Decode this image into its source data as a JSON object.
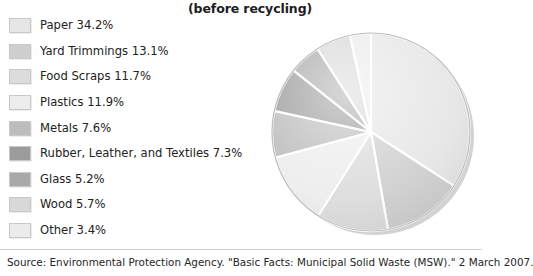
{
  "title": "(before recycling)",
  "source_note": "Source: Environmental Protection Agency. \"Basic Facts: Municipal Solid Waste (MSW).\" 2 March 2007.",
  "legend": {
    "items": [
      {
        "label": "Paper 34.2%",
        "name": "Paper",
        "value": 34.2,
        "color": "#e6e6e6"
      },
      {
        "label": "Yard Trimmings 13.1%",
        "name": "Yard Trimmings",
        "value": 13.1,
        "color": "#cfcfcf"
      },
      {
        "label": "Food Scraps 11.7%",
        "name": "Food Scraps",
        "value": 11.7,
        "color": "#dcdcdc"
      },
      {
        "label": "Plastics 11.9%",
        "name": "Plastics",
        "value": 11.9,
        "color": "#ededed"
      },
      {
        "label": "Metals 7.6%",
        "name": "Metals",
        "value": 7.6,
        "color": "#bcbcbc"
      },
      {
        "label": "Rubber, Leather, and Textiles 7.3%",
        "name": "Rubber, Leather, and Textiles",
        "value": 7.3,
        "color": "#9b9b9b"
      },
      {
        "label": "Glass 5.2%",
        "name": "Glass",
        "value": 5.2,
        "color": "#a9a9a9"
      },
      {
        "label": "Wood 5.7%",
        "name": "Wood",
        "value": 5.7,
        "color": "#d8d8d8"
      },
      {
        "label": "Other 3.4%",
        "name": "Other",
        "value": 3.4,
        "color": "#ebebeb"
      }
    ]
  },
  "chart_data": {
    "type": "pie",
    "title": "(before recycling)",
    "categories": [
      "Paper",
      "Yard Trimmings",
      "Food Scraps",
      "Plastics",
      "Metals",
      "Rubber, Leather, and Textiles",
      "Glass",
      "Wood",
      "Other"
    ],
    "values": [
      34.2,
      13.1,
      11.7,
      11.9,
      7.6,
      7.3,
      5.2,
      5.7,
      3.4
    ],
    "unit": "percent",
    "start_angle_deg": 0,
    "direction": "clockwise",
    "legend_position": "left",
    "grid": false,
    "slice_colors": [
      "#e6e6e6",
      "#cfcfcf",
      "#dcdcdc",
      "#ededed",
      "#bcbcbc",
      "#9b9b9b",
      "#a9a9a9",
      "#d8d8d8",
      "#ebebeb"
    ],
    "xlabel": "",
    "ylabel": ""
  },
  "pie_geometry": {
    "cx": 109,
    "cy": 110,
    "r": 99,
    "shadow_offset": 4
  }
}
